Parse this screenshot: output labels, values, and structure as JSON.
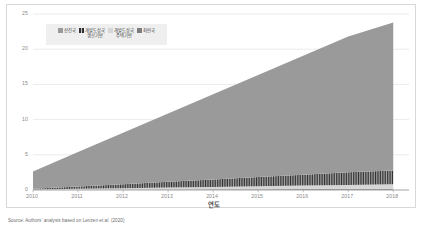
{
  "chart_data": {
    "type": "area",
    "stacked": true,
    "title": "",
    "subtitle": "",
    "xlabel": "연도",
    "ylabel": "",
    "x": [
      2010,
      2011,
      2012,
      2013,
      2014,
      2015,
      2016,
      2017,
      2018
    ],
    "categories": [
      "2010",
      "2011",
      "2012",
      "2013",
      "2014",
      "2015",
      "2016",
      "2017",
      "2018"
    ],
    "xlim": [
      2010,
      2018.35
    ],
    "ylim": [
      0,
      25
    ],
    "yticks": [
      0,
      5,
      10,
      15,
      20,
      25
    ],
    "ytick_labels": [
      "0",
      "5",
      "10",
      "15",
      "20",
      "25"
    ],
    "xticks": [
      2010,
      2011,
      2012,
      2013,
      2014,
      2015,
      2016,
      2017,
      2018
    ],
    "xtick_labels": [
      "2010",
      "2011",
      "2012",
      "2013",
      "2014",
      "2015",
      "2016",
      "2017",
      "2018"
    ],
    "grid": true,
    "grid_axis": "y",
    "legend_position": "top-left",
    "series": [
      {
        "name": "선진국",
        "color": "#9a9a9a",
        "pattern": "solid",
        "values": [
          2.45,
          4.9,
          7.3,
          9.7,
          12.1,
          14.5,
          16.9,
          19.3,
          21.0
        ]
      },
      {
        "name": "개발도상국\n생산기반",
        "color": "#3a3a3a",
        "pattern": "hatch-vertical",
        "values": [
          0.12,
          0.35,
          0.58,
          0.82,
          1.05,
          1.3,
          1.55,
          1.8,
          1.98
        ]
      },
      {
        "name": "개발도상국\n주택기반",
        "color": "#d6d6d6",
        "pattern": "solid",
        "values": [
          0.05,
          0.12,
          0.19,
          0.27,
          0.34,
          0.41,
          0.49,
          0.56,
          0.62
        ]
      },
      {
        "name": "최빈국",
        "color": "#7d7d7d",
        "pattern": "hatch-dot",
        "values": [
          0.02,
          0.04,
          0.06,
          0.08,
          0.1,
          0.12,
          0.14,
          0.16,
          0.18
        ]
      }
    ],
    "totals": [
      2.64,
      5.41,
      8.13,
      10.87,
      13.59,
      16.33,
      19.08,
      21.82,
      23.78
    ]
  },
  "legend": {
    "items": [
      {
        "label": "선진국",
        "color": "#9a9a9a"
      },
      {
        "label": "개발도상국\n생산기반",
        "color": "#3a3a3a"
      },
      {
        "label": "개발도상국\n주택기반",
        "color": "#d6d6d6"
      },
      {
        "label": "최빈국",
        "color": "#7d7d7d"
      }
    ]
  },
  "axis": {
    "x_title": "연도"
  },
  "caption": {
    "text": "Source: Authors' analysis based on Lenzen et al. (2020)"
  },
  "colors": {
    "developed": "#9a9a9a",
    "developing_production": "#3a3a3a",
    "developing_residence": "#d6d6d6",
    "least_developed": "#7d7d7d",
    "grid": "#e3e3e3",
    "axis_text": "#8a8a8a",
    "frame": "#d8d8d8",
    "legend_bg": "#efefef"
  }
}
